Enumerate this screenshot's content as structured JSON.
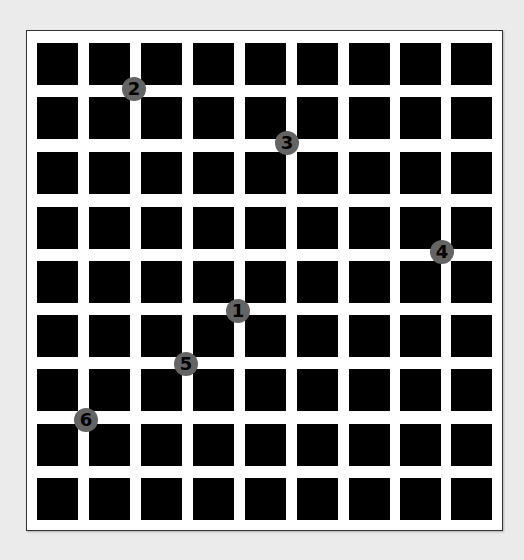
{
  "figure": {
    "grid": {
      "rows": 9,
      "cols": 9,
      "square_color": "#000000",
      "background_color": "#ffffff",
      "page_background": "#ebebeb",
      "col_starts": [
        37,
        89,
        141,
        193,
        245,
        297,
        349,
        400,
        451
      ],
      "row_starts": [
        43,
        97,
        152,
        207,
        261,
        315,
        369,
        424,
        478
      ],
      "square_width": 41,
      "square_height": 42
    },
    "markers": [
      {
        "label": "1",
        "x": 238,
        "y": 311
      },
      {
        "label": "2",
        "x": 134,
        "y": 89
      },
      {
        "label": "3",
        "x": 287,
        "y": 143
      },
      {
        "label": "4",
        "x": 442,
        "y": 252
      },
      {
        "label": "5",
        "x": 186,
        "y": 364
      },
      {
        "label": "6",
        "x": 86,
        "y": 420
      }
    ],
    "marker_color": "#646464",
    "marker_text_color": "#000000"
  }
}
